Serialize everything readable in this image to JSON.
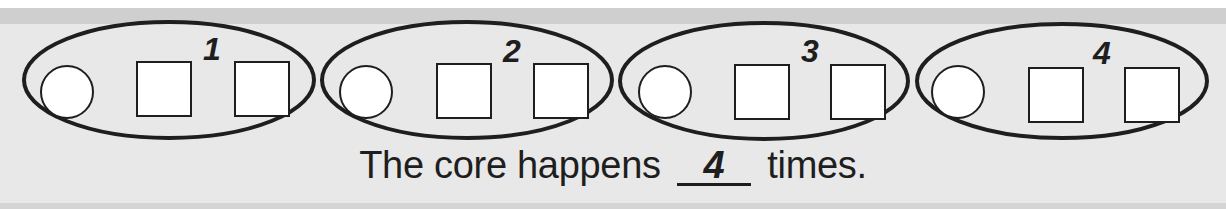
{
  "pattern": {
    "groups": [
      {
        "label": "1",
        "shapes": [
          "circle",
          "square",
          "square"
        ]
      },
      {
        "label": "2",
        "shapes": [
          "circle",
          "square",
          "square"
        ]
      },
      {
        "label": "3",
        "shapes": [
          "circle",
          "square",
          "square"
        ]
      },
      {
        "label": "4",
        "shapes": [
          "circle",
          "square",
          "square"
        ]
      }
    ]
  },
  "sentence": {
    "before": "The core happens",
    "answer": "4",
    "after": "times."
  },
  "colors": {
    "ink": "#1e1e1e",
    "background": "#e8e8e8",
    "band": "#cfcfcf",
    "shape_fill": "#ffffff"
  }
}
